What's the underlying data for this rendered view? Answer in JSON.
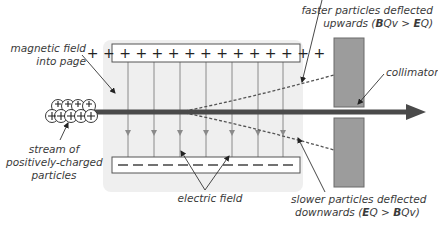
{
  "diagram": {
    "colors": {
      "panel": "#efefef",
      "plate_fill": "#ffffff",
      "plate_border": "#555555",
      "field_line": "#8a8a8a",
      "beam": "#4a4a4a",
      "collimator": "#9c9c9c",
      "text": "#3a3a3a"
    },
    "top_plate": {
      "charge": "+",
      "symbols": "+ + + + + + + + + + + + + + +"
    },
    "bottom_plate": {
      "charge": "-",
      "symbols": "— — — — — — — — — — — —"
    },
    "labels": {
      "magnetic_field": [
        "magnetic field",
        "into page"
      ],
      "stream": [
        "stream of",
        "positively-charged",
        "particles"
      ],
      "electric_field": "electric field",
      "collimator": "collimator",
      "faster": {
        "line1": "faster particles deflected",
        "line2_prefix": "upwards (",
        "B": "B",
        "Qv": "Qv",
        "gt": " > ",
        "E": "E",
        "Q": "Q)"
      },
      "slower": {
        "line1": "slower particles deflected",
        "line2_prefix": "downwards (",
        "E": "E",
        "Q": "Q",
        "gt": " > ",
        "B": "B",
        "Qv": "Qv)"
      }
    },
    "field_lines_count": 7,
    "particles_count": 10
  }
}
